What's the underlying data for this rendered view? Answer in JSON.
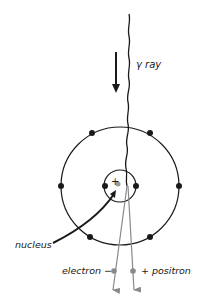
{
  "diagram": {
    "labels": {
      "gamma_ray": "γ ray",
      "nucleus": "nucleus",
      "electron": "electron −",
      "positron": "+ positron",
      "nucleus_charge": "+"
    },
    "colors": {
      "ink": "#1a1a1a",
      "particle_track": "#8a8a8a",
      "nucleus_dot": "#9a9a9a",
      "background": "#ffffff"
    },
    "atom": {
      "center": [
        120,
        186
      ],
      "outer_orbit_radius": 59,
      "inner_orbit_radius": 16,
      "outer_electrons": 8,
      "inner_electrons": 2
    }
  }
}
